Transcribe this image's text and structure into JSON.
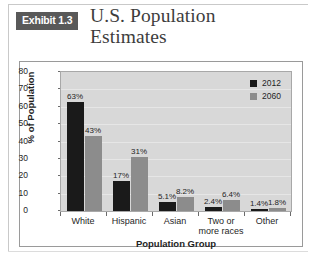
{
  "header": {
    "badge": "Exhibit 1.3",
    "title_line1": "U.S. Population",
    "title_line2": "Estimates"
  },
  "legend": {
    "series": [
      {
        "name": "2012",
        "color": "#1a1a1a"
      },
      {
        "name": "2060",
        "color": "#8c8c8c"
      }
    ]
  },
  "axis": {
    "y_ticks": [
      "80",
      "70",
      "60",
      "50",
      "40",
      "30",
      "20",
      "10",
      "0"
    ],
    "y_title": "% of Population",
    "x_title": "Population Group"
  },
  "chart_data": {
    "type": "bar",
    "title": "U.S. Population Estimates",
    "categories": [
      "White",
      "Hispanic",
      "Asian",
      "Two or\nmore races",
      "Other"
    ],
    "category_labels": [
      {
        "line1": "White",
        "line2": ""
      },
      {
        "line1": "Hispanic",
        "line2": ""
      },
      {
        "line1": "Asian",
        "line2": ""
      },
      {
        "line1": "Two or",
        "line2": "more races"
      },
      {
        "line1": "Other",
        "line2": ""
      }
    ],
    "series": [
      {
        "name": "2012",
        "color": "#1a1a1a",
        "values": [
          63,
          17,
          5.1,
          2.4,
          1.4
        ],
        "labels": [
          "63%",
          "17%",
          "5.1%",
          "2.4%",
          "1.4%"
        ]
      },
      {
        "name": "2060",
        "color": "#8c8c8c",
        "values": [
          43,
          31,
          8.2,
          6.4,
          1.8
        ],
        "labels": [
          "43%",
          "31%",
          "8.2%",
          "6.4%",
          "1.8%"
        ]
      }
    ],
    "xlabel": "Population Group",
    "ylabel": "% of Population",
    "ylim": [
      0,
      80
    ],
    "ytick_step": 10,
    "grid": true,
    "legend_position": "top-right"
  }
}
